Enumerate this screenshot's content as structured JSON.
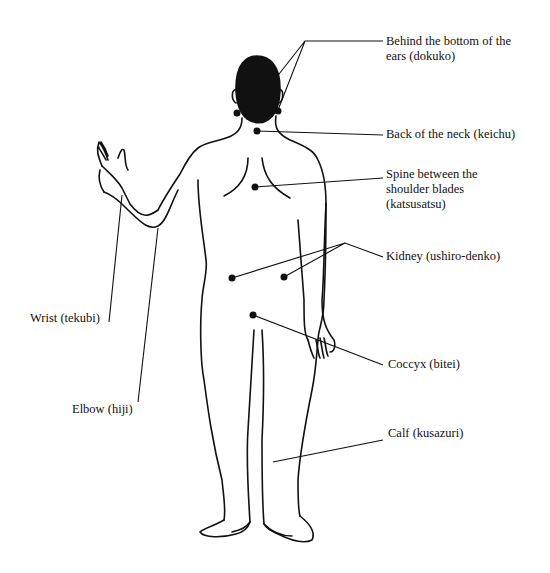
{
  "diagram": {
    "labels": {
      "dokuko": {
        "line1": "Behind the bottom of the",
        "line2": "ears (dokuko)"
      },
      "keichu": "Back of the neck (keichu)",
      "katsusatsu": {
        "line1": "Spine between the",
        "line2": "shoulder blades",
        "line3": "(katsusatsu)"
      },
      "kidney": "Kidney (ushiro-denko)",
      "coccyx": "Coccyx (bitei)",
      "calf": "Calf (kusazuri)",
      "wrist": "Wrist (tekubi)",
      "elbow": "Elbow (hiji)"
    },
    "colors": {
      "line": "#111111",
      "fill": "#111111",
      "background": "#ffffff"
    }
  }
}
